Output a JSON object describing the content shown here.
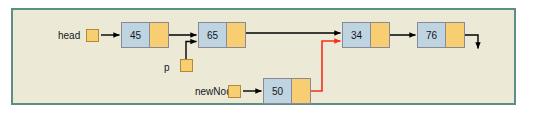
{
  "figure": {
    "frame": {
      "border_color": "#5e8d84",
      "background_color": "#ecead6",
      "page_background": "#ffffff"
    },
    "palette": {
      "data_cell": "#bed5e1",
      "pointer_cell": "#f7cf72",
      "node_border": "#8a8a96",
      "varbox_border": "#b08a35",
      "link_black": "#000000",
      "link_red": "#f4301a",
      "text": "#16161c"
    }
  },
  "labels": {
    "head": "head",
    "p": "p",
    "new_node": "newNode"
  },
  "nodes": [
    {
      "id": "node-45",
      "value": "45",
      "x": 121,
      "y": 22
    },
    {
      "id": "node-65",
      "value": "65",
      "x": 198,
      "y": 22
    },
    {
      "id": "node-34",
      "value": "34",
      "x": 342,
      "y": 22
    },
    {
      "id": "node-76",
      "value": "76",
      "x": 417,
      "y": 22
    },
    {
      "id": "node-50",
      "value": "50",
      "x": 263,
      "y": 78
    }
  ],
  "pointers": [
    {
      "id": "head",
      "label": "head",
      "target": "node-45",
      "color": "#000000"
    },
    {
      "id": "p",
      "label": "p",
      "target": "node-65",
      "color": "#000000"
    },
    {
      "id": "newNode",
      "label": "newNode",
      "target": "node-50",
      "color": "#000000"
    }
  ],
  "links": [
    {
      "from": "node-45",
      "to": "node-65",
      "color": "#000000"
    },
    {
      "from": "node-65",
      "to": "node-34",
      "color": "#000000"
    },
    {
      "from": "node-34",
      "to": "node-76",
      "color": "#000000"
    },
    {
      "from": "node-76",
      "to": "null",
      "color": "#000000"
    },
    {
      "from": "node-50",
      "to": "node-34",
      "color": "#f4301a"
    }
  ]
}
